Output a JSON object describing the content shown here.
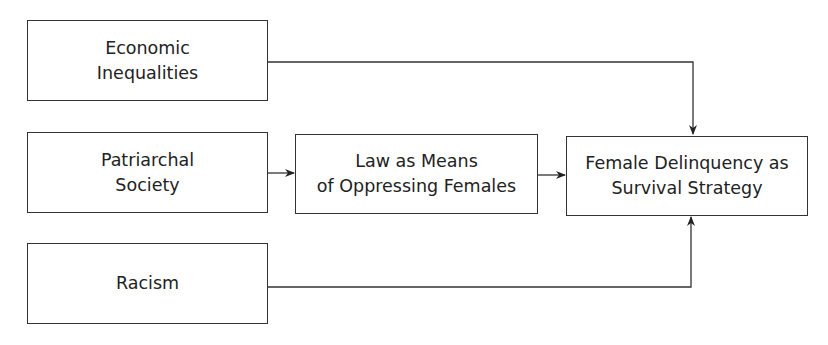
{
  "diagram": {
    "nodes": [
      {
        "id": "economic-inequalities",
        "lines": [
          "Economic",
          "Inequalities"
        ]
      },
      {
        "id": "patriarchal-society",
        "lines": [
          "Patriarchal",
          "Society"
        ]
      },
      {
        "id": "racism",
        "lines": [
          "Racism"
        ]
      },
      {
        "id": "law-as-means",
        "lines": [
          "Law as Means",
          "of Oppressing Females"
        ]
      },
      {
        "id": "female-delinquency",
        "lines": [
          "Female Delinquency as",
          "Survival Strategy"
        ]
      }
    ],
    "edges": [
      {
        "from": "economic-inequalities",
        "to": "female-delinquency"
      },
      {
        "from": "patriarchal-society",
        "to": "law-as-means"
      },
      {
        "from": "law-as-means",
        "to": "female-delinquency"
      },
      {
        "from": "racism",
        "to": "female-delinquency"
      }
    ],
    "colors": {
      "stroke": "#333333",
      "background": "#ffffff"
    }
  }
}
